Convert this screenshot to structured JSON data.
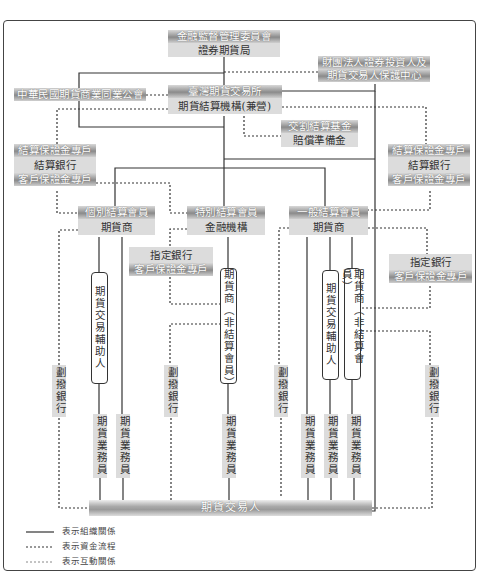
{
  "diagram": {
    "regulator": {
      "top": "金融監督管理委員會",
      "sub": "證券期貨局"
    },
    "investor_protection": {
      "line1": "財團法人證券投資人及",
      "line2": "期貨交易人保護中心"
    },
    "association": {
      "label": "中華民國期貨商業同業公會"
    },
    "exchange": {
      "top": "臺灣期貨交易所",
      "sub": "期貨結算機構(兼營)"
    },
    "settlement_fund": {
      "top": "交割結算基金",
      "sub": "賠償準備金"
    },
    "left_bank_stack": {
      "top": "結算保證金專戶",
      "mid": "結算銀行",
      "bottom": "客戶保證金專戶"
    },
    "right_bank_stack": {
      "top": "結算保證金專戶",
      "mid": "結算銀行",
      "bottom": "客戶保證金專戶"
    },
    "members": [
      {
        "top": "個別結算會員",
        "sub": "期貨商"
      },
      {
        "top": "特別結算會員",
        "sub": "金融機構"
      },
      {
        "top": "一般結算會員",
        "sub": "期貨商"
      }
    ],
    "designated_bank_left": {
      "top": "指定銀行",
      "sub": "客戶保證金專戶"
    },
    "designated_bank_right": {
      "top": "指定銀行",
      "sub": "客戶保證金專戶"
    },
    "capsules": {
      "ib_left": "期貨交易輔助人",
      "fcm_mid": "期貨商（非結算會員）",
      "ib_right": "期貨交易輔助人",
      "fcm_right": "期貨商（非結算會員）"
    },
    "transfer_banks": [
      "劃撥銀行",
      "劃撥銀行",
      "劃撥銀行",
      "劃撥銀行"
    ],
    "salespersons": [
      "期貨業務員",
      "期貨業務員",
      "期貨業務員",
      "期貨業務員",
      "期貨業務員",
      "期貨業務員"
    ],
    "traders": "期貨交易人",
    "legend": [
      {
        "style": "solid",
        "label": "表示組織關係"
      },
      {
        "style": "dotted-dark",
        "label": "表示資金流程"
      },
      {
        "style": "dotted-light",
        "label": "表示互動關係"
      }
    ]
  }
}
